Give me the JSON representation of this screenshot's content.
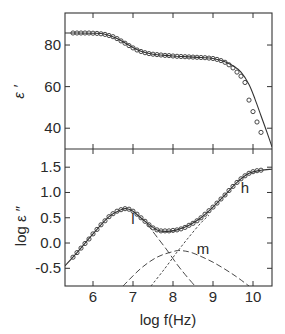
{
  "chart_data": [
    {
      "type": "scatter",
      "panel": "top",
      "title": "",
      "xlabel": "log f(Hz)",
      "ylabel": "ε ′",
      "xlim": [
        5.3,
        10.475
      ],
      "ylim": [
        30,
        95.4
      ],
      "yticks": [
        40,
        60,
        80
      ],
      "ytick_labels": [
        "40",
        "60",
        "80"
      ],
      "xticks": [
        6,
        7,
        8,
        9,
        10
      ],
      "grid": false,
      "series": [
        {
          "name": "ε′ data",
          "style": "open-circles",
          "x": [
            5.5,
            5.6,
            5.7,
            5.8,
            5.9,
            6.0,
            6.1,
            6.2,
            6.3,
            6.4,
            6.5,
            6.6,
            6.7,
            6.8,
            6.9,
            7.0,
            7.1,
            7.2,
            7.3,
            7.4,
            7.5,
            7.6,
            7.7,
            7.8,
            7.9,
            8.0,
            8.1,
            8.2,
            8.3,
            8.4,
            8.5,
            8.6,
            8.7,
            8.8,
            8.9,
            9.0,
            9.1,
            9.2,
            9.3,
            9.4,
            9.5,
            9.6,
            9.7,
            9.8,
            9.9,
            10.0,
            10.1,
            10.2
          ],
          "y": [
            85.8,
            85.8,
            85.8,
            85.8,
            85.8,
            85.7,
            85.6,
            85.4,
            85.1,
            84.6,
            84.0,
            83.1,
            82.0,
            80.9,
            79.7,
            78.6,
            77.6,
            76.9,
            76.3,
            75.9,
            75.6,
            75.4,
            75.2,
            75.0,
            74.9,
            74.7,
            74.6,
            74.5,
            74.4,
            74.3,
            74.2,
            74.1,
            74.0,
            73.9,
            73.7,
            73.5,
            73.1,
            72.5,
            71.7,
            70.5,
            69.0,
            67.0,
            65.0,
            62.0,
            53.5,
            48.0,
            43.0,
            38.0
          ]
        },
        {
          "name": "ε′ fit",
          "style": "solid-line",
          "x": [
            5.3,
            5.6,
            6.0,
            6.3,
            6.6,
            6.9,
            7.2,
            7.5,
            7.8,
            8.1,
            8.4,
            8.7,
            9.0,
            9.3,
            9.5,
            9.7,
            9.9,
            10.05,
            10.2,
            10.35,
            10.475
          ],
          "y": [
            85.8,
            85.8,
            85.7,
            85.2,
            83.2,
            79.9,
            77.0,
            75.6,
            75.0,
            74.6,
            74.3,
            74.0,
            73.5,
            72.0,
            70.0,
            67.0,
            61.0,
            54.0,
            46.0,
            38.0,
            31.0
          ]
        }
      ]
    },
    {
      "type": "scatter",
      "panel": "bottom",
      "title": "",
      "xlabel": "log f(Hz)",
      "ylabel": "log ε ″",
      "xlim": [
        5.3,
        10.475
      ],
      "ylim": [
        -0.85,
        1.86
      ],
      "xticks": [
        6,
        7,
        8,
        9,
        10
      ],
      "xtick_labels": [
        "6",
        "7",
        "8",
        "9",
        "10"
      ],
      "yticks": [
        -0.5,
        0.0,
        0.5,
        1.0,
        1.5
      ],
      "ytick_labels": [
        "-0.5",
        "0.0",
        "0.5",
        "1.0",
        "1.5"
      ],
      "grid": false,
      "annotations": [
        {
          "text": "l",
          "x": 7.0,
          "y": 0.38
        },
        {
          "text": "m",
          "x": 8.75,
          "y": -0.22
        },
        {
          "text": "h",
          "x": 9.8,
          "y": 0.98
        }
      ],
      "series": [
        {
          "name": "log ε″ data",
          "style": "open-circles",
          "x": [
            5.5,
            5.6,
            5.7,
            5.8,
            5.9,
            6.0,
            6.1,
            6.2,
            6.3,
            6.4,
            6.5,
            6.6,
            6.7,
            6.8,
            6.9,
            7.0,
            7.1,
            7.2,
            7.3,
            7.4,
            7.5,
            7.6,
            7.7,
            7.8,
            7.9,
            8.0,
            8.1,
            8.2,
            8.3,
            8.4,
            8.5,
            8.6,
            8.7,
            8.8,
            8.9,
            9.0,
            9.1,
            9.2,
            9.3,
            9.4,
            9.5,
            9.6,
            9.7,
            9.8,
            9.9,
            10.0,
            10.1,
            10.2
          ],
          "y": [
            -0.28,
            -0.19,
            -0.1,
            -0.01,
            0.08,
            0.18,
            0.27,
            0.36,
            0.44,
            0.52,
            0.58,
            0.63,
            0.66,
            0.68,
            0.67,
            0.63,
            0.57,
            0.5,
            0.43,
            0.36,
            0.3,
            0.26,
            0.24,
            0.24,
            0.24,
            0.25,
            0.26,
            0.28,
            0.31,
            0.35,
            0.39,
            0.44,
            0.5,
            0.57,
            0.64,
            0.71,
            0.79,
            0.87,
            0.95,
            1.04,
            1.12,
            1.2,
            1.27,
            1.33,
            1.38,
            1.41,
            1.43,
            1.44
          ]
        },
        {
          "name": "log ε″ fit",
          "style": "solid-line",
          "x": [
            5.3,
            5.6,
            6.0,
            6.4,
            6.7,
            6.85,
            7.0,
            7.3,
            7.6,
            7.85,
            8.1,
            8.4,
            8.7,
            9.0,
            9.3,
            9.6,
            9.9,
            10.2,
            10.475
          ],
          "y": [
            -0.45,
            -0.19,
            0.18,
            0.52,
            0.66,
            0.68,
            0.63,
            0.43,
            0.26,
            0.23,
            0.26,
            0.35,
            0.5,
            0.71,
            0.95,
            1.2,
            1.38,
            1.44,
            1.46
          ]
        },
        {
          "name": "l (low-frequency relaxation)",
          "style": "long-dash",
          "x": [
            7.35,
            7.6,
            7.85,
            8.1,
            8.3,
            8.55
          ],
          "y": [
            0.38,
            0.12,
            -0.14,
            -0.42,
            -0.62,
            -0.85
          ]
        },
        {
          "name": "m (middle relaxation)",
          "style": "dash",
          "x": [
            6.75,
            7.2,
            7.6,
            8.0,
            8.2,
            8.5,
            9.0,
            9.5,
            9.9
          ],
          "y": [
            -0.85,
            -0.5,
            -0.28,
            -0.17,
            -0.15,
            -0.2,
            -0.38,
            -0.62,
            -0.85
          ]
        },
        {
          "name": "h (high-frequency relaxation)",
          "style": "short-dash",
          "x": [
            7.45,
            7.8,
            8.1,
            8.4,
            8.7,
            8.9
          ],
          "y": [
            -0.85,
            -0.5,
            -0.18,
            0.12,
            0.4,
            0.55
          ]
        }
      ]
    }
  ],
  "labels": {
    "top_ylabel": "ε ′",
    "bottom_ylabel": "log ε ″",
    "xlabel": "log f(Hz)"
  }
}
